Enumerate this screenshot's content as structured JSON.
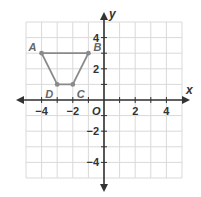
{
  "diagram": {
    "type": "coordinate-plane",
    "axes": {
      "x_label": "x",
      "y_label": "y",
      "origin_label": "O",
      "x_range": [
        -5,
        5
      ],
      "y_range": [
        -5,
        5
      ],
      "x_ticks": [
        {
          "value": -4,
          "label": "−4"
        },
        {
          "value": -2,
          "label": "−2"
        },
        {
          "value": 2,
          "label": "2"
        },
        {
          "value": 4,
          "label": "4"
        }
      ],
      "y_ticks": [
        {
          "value": 4,
          "label": "4"
        },
        {
          "value": 2,
          "label": "2"
        },
        {
          "value": -2,
          "label": "−2"
        },
        {
          "value": -4,
          "label": "−4"
        }
      ]
    },
    "shape": {
      "name": "trapezoid ABCD",
      "vertices": [
        {
          "label": "A",
          "x": -4,
          "y": 3
        },
        {
          "label": "B",
          "x": -1,
          "y": 3
        },
        {
          "label": "C",
          "x": -2,
          "y": 1
        },
        {
          "label": "D",
          "x": -3,
          "y": 1
        }
      ]
    },
    "colors": {
      "grid": "#d9d9d9",
      "axis": "#333333",
      "shape": "#8a8a8a",
      "label_text": "#666666",
      "axis_text": "#333333"
    }
  }
}
